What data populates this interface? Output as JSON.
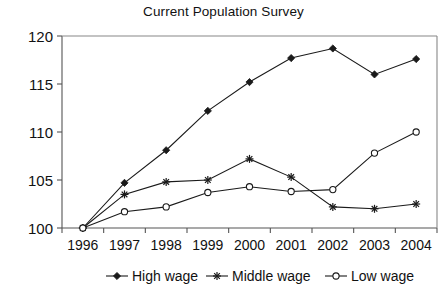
{
  "chart_data": {
    "type": "line",
    "title": "Current Population Survey",
    "xlabel": "",
    "ylabel": "",
    "categories": [
      "1996",
      "1997",
      "1998",
      "1999",
      "2000",
      "2001",
      "2002",
      "2003",
      "2004"
    ],
    "ylim": [
      100,
      120
    ],
    "yticks": [
      100,
      105,
      110,
      115,
      120
    ],
    "grid": false,
    "legend_position": "bottom",
    "series": [
      {
        "name": "High wage",
        "marker": "filled-diamond",
        "values": [
          100,
          104.7,
          108.1,
          112.2,
          115.2,
          117.7,
          118.7,
          116.0,
          117.6
        ]
      },
      {
        "name": "Middle wage",
        "marker": "asterisk",
        "values": [
          100,
          103.5,
          104.8,
          105.0,
          107.2,
          105.3,
          102.2,
          102.0,
          102.5
        ]
      },
      {
        "name": "Low wage",
        "marker": "open-circle",
        "values": [
          100,
          101.7,
          102.2,
          103.7,
          104.3,
          103.8,
          104.0,
          107.8,
          110.0
        ]
      }
    ],
    "colors": {
      "series_line": "#1a1a1a",
      "axis": "#555555",
      "frame": "#888888",
      "text": "#111111",
      "background": "#ffffff"
    }
  }
}
